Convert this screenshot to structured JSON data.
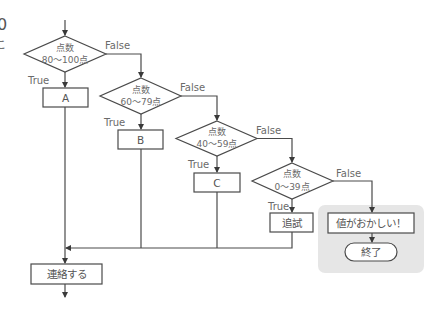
{
  "diagram": {
    "type": "flowchart",
    "edge_fragment": {
      "mark1": "0",
      "mark2": "こ"
    },
    "decisions": [
      {
        "id": "d1",
        "line1": "点数",
        "line2": "80〜100点",
        "true_label": "True",
        "false_label": "False"
      },
      {
        "id": "d2",
        "line1": "点数",
        "line2": "60〜79点",
        "true_label": "True",
        "false_label": "False"
      },
      {
        "id": "d3",
        "line1": "点数",
        "line2": "40〜59点",
        "true_label": "True",
        "false_label": "False"
      },
      {
        "id": "d4",
        "line1": "点数",
        "line2": "0〜39点",
        "true_label": "True",
        "false_label": "False"
      }
    ],
    "processes": [
      {
        "id": "pA",
        "label": "A"
      },
      {
        "id": "pB",
        "label": "B"
      },
      {
        "id": "pC",
        "label": "C"
      },
      {
        "id": "pRetest",
        "label": "追試"
      },
      {
        "id": "pError",
        "label": "値がおかしい！"
      },
      {
        "id": "pContact",
        "label": "連絡する"
      }
    ],
    "terminals": [
      {
        "id": "tEnd",
        "label": "終了"
      }
    ],
    "highlight_panel": {
      "color": "#e6e6e6"
    },
    "colors": {
      "line": "#4a4a4a",
      "text": "#555555",
      "panel": "#e6e6e6"
    }
  }
}
